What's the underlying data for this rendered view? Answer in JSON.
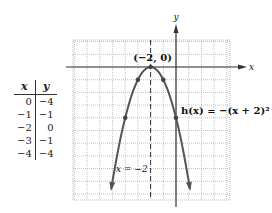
{
  "chart_data": {
    "type": "line",
    "title": "",
    "function_label": "h(x) = −(x + 2)²",
    "vertex_label": "(−2, 0)",
    "axis_of_symmetry_label": "x = −2",
    "xlabel": "x",
    "ylabel": "y",
    "xlim": [
      -8,
      4
    ],
    "ylim": [
      -10,
      2
    ],
    "grid": true,
    "points": [
      {
        "x": 0,
        "y": -4
      },
      {
        "x": -1,
        "y": -1
      },
      {
        "x": -2,
        "y": 0
      },
      {
        "x": -3,
        "y": -1
      },
      {
        "x": -4,
        "y": -4
      }
    ],
    "curve_color": "#555555",
    "grid_color": "#aaaaaa"
  },
  "table": {
    "headers": [
      "x",
      "y"
    ],
    "rows": [
      [
        "0",
        "−4"
      ],
      [
        "−1",
        "−1"
      ],
      [
        "−2",
        "0"
      ],
      [
        "−3",
        "−1"
      ],
      [
        "−4",
        "−4"
      ]
    ]
  }
}
